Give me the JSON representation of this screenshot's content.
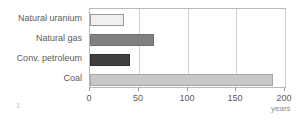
{
  "figure": {
    "number_label": "1",
    "background": "#ffffff"
  },
  "chart_data": {
    "type": "bar",
    "orientation": "horizontal",
    "title": "",
    "subtitle": "",
    "xlabel": "years",
    "ylabel": "",
    "categories": [
      "Natural uranium",
      "Natural gas",
      "Conv. petroleum",
      "Coal"
    ],
    "values": [
      35,
      66,
      41,
      188
    ],
    "units": "years",
    "xlim": [
      0,
      200
    ],
    "xticks": [
      0,
      50,
      100,
      150,
      200
    ],
    "xtick_labels": [
      "0",
      "50",
      "100",
      "150",
      "200"
    ],
    "grid": true,
    "grid_axis": "x",
    "legend": false,
    "legend_position": "none",
    "bar_colors": [
      "#f0f0f0",
      "#808080",
      "#3f3f3f",
      "#c8c8c8"
    ],
    "bar_border_colors": [
      "#9a9a9a",
      "#6e6e6e",
      "#2e2e2e",
      "#a8a8a8"
    ],
    "series": [
      {
        "name": "Reserve lifetime",
        "points": [
          {
            "category": "Natural uranium",
            "value": 35,
            "color": "#f0f0f0"
          },
          {
            "category": "Natural gas",
            "value": 66,
            "color": "#808080"
          },
          {
            "category": "Conv. petroleum",
            "value": 41,
            "color": "#3f3f3f"
          },
          {
            "category": "Coal",
            "value": 188,
            "color": "#c8c8c8"
          }
        ]
      }
    ],
    "colors": {
      "axis": "#b9b9b9",
      "gridline": "#cfcfcf",
      "tick": "#9a9a9a",
      "text": "#5b5b5b",
      "axis_title_text": "#8a8a8a"
    }
  }
}
